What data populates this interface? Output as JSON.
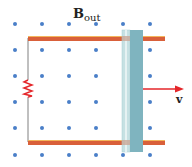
{
  "diagram": {
    "field_label": {
      "main": "B",
      "subscript": "out"
    },
    "velocity_label": "v",
    "colors": {
      "dot": "#4a7fc8",
      "rail": "#d9603a",
      "rail_highlight": "#f3b55b",
      "bar_dark": "#7fb4bf",
      "bar_light": "#c6e1e3",
      "arrow": "#e4262a",
      "resistor": "#e4262a",
      "wire": "#808080"
    },
    "dot_columns": [
      15,
      42,
      69,
      96,
      123,
      150
    ],
    "dot_rows": [
      24,
      50,
      76,
      102,
      128,
      155
    ]
  }
}
